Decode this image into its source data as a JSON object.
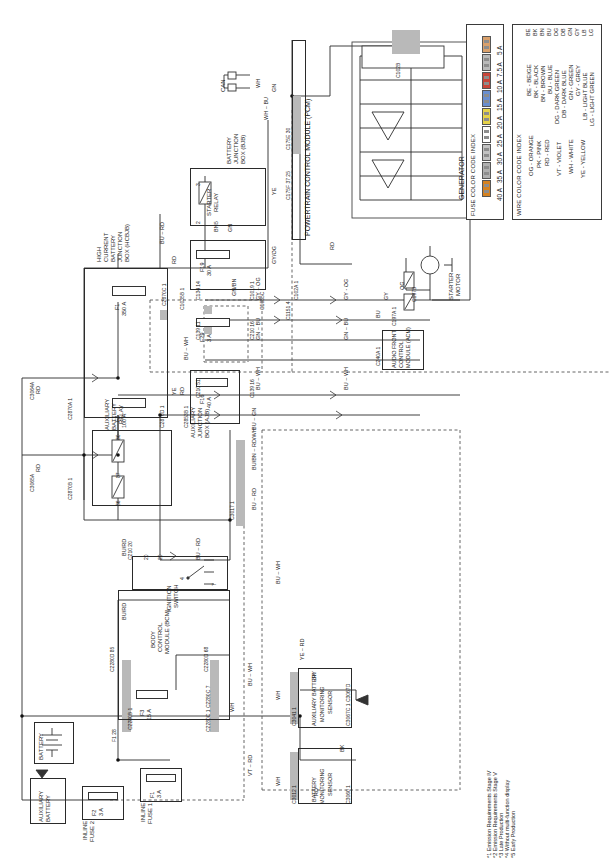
{
  "document": {
    "type": "automotive-wiring-diagram",
    "title": "Charging / Starting System Wiring Diagram"
  },
  "legends": {
    "fuse_index": {
      "title": "FUSE COLOR CODE INDEX",
      "ratings": [
        "5 A",
        "7.5 A",
        "10 A",
        "15 A",
        "20 A",
        "25 A",
        "30 A",
        "35 A",
        "40 A"
      ],
      "colors": [
        "#d9a06b",
        "#b9b9b9",
        "#c8453a",
        "#6a8fd0",
        "#e6d34a",
        "#ffffff",
        "#c2c2c2",
        "#b0b0b0",
        "#d6821f"
      ]
    },
    "wire_index": {
      "title": "WIRE COLOR CODE INDEX",
      "entries": [
        "BE - BEIGE",
        "BK - BLACK",
        "BN - BROWN",
        "BU - BLUE",
        "DG - DARK GREEN",
        "DB - DARK BLUE",
        "GN - GREEN",
        "GY - GREY",
        "LB - LIGHT BLUE",
        "LG - LIGHT GREEN",
        "OG - ORANGE",
        "PK - PINK",
        "RD - RED",
        "VT - VIOLET",
        "WH - WHITE",
        "YE - YELLOW"
      ],
      "codes": [
        "BE",
        "BK",
        "BN",
        "BU",
        "DG",
        "DB",
        "GN",
        "GY",
        "LB",
        "LG",
        "OG",
        "PK",
        "RD",
        "VT",
        "WH",
        "YE"
      ]
    }
  },
  "footnotes": [
    "*1 Emission Requirements Stage IV",
    "*2 Emission Requirements Stage V",
    "*3 Late Production",
    "*4 Without multi-function display",
    "*5 Early Production"
  ],
  "modules": {
    "pcm": "POWERTRAIN CONTROL MODULE (PCM)",
    "generator": "GENERATOR",
    "bjb": "BATTERY JUNCTION BOX (BJB)",
    "starter_relay": "STARTER RELAY",
    "hcbjb": "HIGH CURRENT BATTERY JUNCTION BOX (HCBJB)",
    "ajb": "AUXILIARY JUNCTION BOX (AJB)",
    "aux_battery_relay": "AUXILIARY BATTERY RELAY",
    "acm": "AUDIO FRONT CONTROL MODULE (ACM)",
    "starter_motor": "STARTER MOTOR",
    "ignition_switch": "IGNITION SWITCH",
    "bcm": "BODY CONTROL MODULE (BCM)",
    "battery": "BATTERY",
    "aux_battery": "AUXILIARY BATTERY",
    "inline_fuse_1": "INLINE FUSE 1",
    "inline_fuse_2": "INLINE FUSE 2",
    "bms": "BATTERY MONITORING SENSOR",
    "aux_bms": "AUXILIARY BATTERY MONITORING SENSOR",
    "can": "CAN"
  },
  "fuses": [
    {
      "id": "F1",
      "rating": "350 A",
      "location": "hcbjb"
    },
    {
      "id": "F2",
      "rating": "100 A",
      "location": "hcbjb"
    },
    {
      "id": "F19",
      "rating": "30 A",
      "location": "bjb"
    },
    {
      "id": "F29",
      "rating": "3 A",
      "location": "bjb"
    },
    {
      "id": "F16",
      "rating": "40 A",
      "location": "ajb"
    },
    {
      "id": "F3",
      "rating": "15 A",
      "location": "bcm"
    },
    {
      "id": "F1",
      "rating": "3 A",
      "location": "inline_fuse_1"
    },
    {
      "id": "F2",
      "rating": "3 A",
      "location": "inline_fuse_2"
    }
  ],
  "connectors": [
    "C175E",
    "C102B",
    "C102A",
    "C1151",
    "C175D",
    "C175F",
    "C2870C",
    "C1035B",
    "C1035C",
    "C2870A",
    "C2870D",
    "C2853B",
    "C2870B",
    "C3064A",
    "C3065A",
    "C3017",
    "C134",
    "C1019",
    "C139",
    "C210",
    "C197A",
    "C197B",
    "C240A",
    "C2280D",
    "C2280C",
    "C2280B",
    "C306A",
    "C306B",
    "C3067",
    "C3060",
    "C3067C",
    "C3067D",
    "C3061",
    "C3041",
    "C3012"
  ],
  "wire_labels": [
    "GN",
    "WH",
    "BU",
    "YE",
    "RD",
    "BN",
    "GY",
    "OG",
    "BK",
    "VT",
    "WH",
    "GY/OG",
    "GN/BN",
    "RD/WH",
    "BU/BN",
    "GY - OG",
    "GN - BN",
    "BU - WH",
    "VT - RD"
  ],
  "pin_numbers": [
    "1",
    "2",
    "3",
    "4",
    "5",
    "6",
    "7",
    "11",
    "14",
    "16",
    "20",
    "25",
    "30",
    "37",
    "51",
    "68",
    "85",
    "86",
    "87"
  ]
}
